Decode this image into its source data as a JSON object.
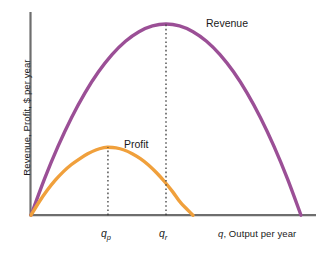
{
  "chart_data": {
    "type": "line",
    "title": "",
    "subtitle": "",
    "xlabel": "q, Output per year",
    "ylabel": "Revenue, Profit, $ per year",
    "xlabel_parts": {
      "variable": "q",
      "rest": ", Output per year"
    },
    "grid": false,
    "legend_position": "inline-curve-labels",
    "axis": {
      "x_range": [
        0,
        1
      ],
      "y_range": [
        0,
        1
      ],
      "x_ticks": [
        "q_p",
        "q_r"
      ],
      "x_tick_values": [
        0.285,
        0.5
      ],
      "y_ticks": []
    },
    "annotations": [
      {
        "name": "dropline-profit-peak",
        "x": 0.285,
        "y_from": 0,
        "y_to": 0.355,
        "style": "dotted"
      },
      {
        "name": "dropline-revenue-peak",
        "x": 0.5,
        "y_from": 0,
        "y_to": 1.0,
        "style": "dotted"
      }
    ],
    "series": [
      {
        "name": "Revenue",
        "label": "Revenue",
        "color": "#9b4f96",
        "shape": "concave-parabola",
        "x_intercepts": [
          0.0,
          1.0
        ],
        "peak": {
          "x": 0.5,
          "y": 1.0
        },
        "points": [
          {
            "x": 0.0,
            "y": 0.0
          },
          {
            "x": 0.05,
            "y": 0.19
          },
          {
            "x": 0.1,
            "y": 0.36
          },
          {
            "x": 0.15,
            "y": 0.51
          },
          {
            "x": 0.2,
            "y": 0.64
          },
          {
            "x": 0.25,
            "y": 0.75
          },
          {
            "x": 0.3,
            "y": 0.84
          },
          {
            "x": 0.35,
            "y": 0.91
          },
          {
            "x": 0.4,
            "y": 0.96
          },
          {
            "x": 0.45,
            "y": 0.99
          },
          {
            "x": 0.5,
            "y": 1.0
          },
          {
            "x": 0.55,
            "y": 0.99
          },
          {
            "x": 0.6,
            "y": 0.96
          },
          {
            "x": 0.65,
            "y": 0.91
          },
          {
            "x": 0.7,
            "y": 0.84
          },
          {
            "x": 0.75,
            "y": 0.75
          },
          {
            "x": 0.8,
            "y": 0.64
          },
          {
            "x": 0.85,
            "y": 0.51
          },
          {
            "x": 0.9,
            "y": 0.36
          },
          {
            "x": 0.95,
            "y": 0.19
          },
          {
            "x": 1.0,
            "y": 0.0
          }
        ]
      },
      {
        "name": "Profit",
        "label": "Profit",
        "color": "#f0a03c",
        "shape": "concave-parabola",
        "x_intercepts": [
          0.0,
          0.6
        ],
        "peak": {
          "x": 0.285,
          "y": 0.355
        },
        "points": [
          {
            "x": 0.0,
            "y": 0.0
          },
          {
            "x": 0.03,
            "y": 0.069
          },
          {
            "x": 0.06,
            "y": 0.13
          },
          {
            "x": 0.09,
            "y": 0.183
          },
          {
            "x": 0.12,
            "y": 0.228
          },
          {
            "x": 0.15,
            "y": 0.265
          },
          {
            "x": 0.18,
            "y": 0.295
          },
          {
            "x": 0.21,
            "y": 0.321
          },
          {
            "x": 0.24,
            "y": 0.341
          },
          {
            "x": 0.27,
            "y": 0.353
          },
          {
            "x": 0.285,
            "y": 0.355
          },
          {
            "x": 0.315,
            "y": 0.352
          },
          {
            "x": 0.345,
            "y": 0.341
          },
          {
            "x": 0.375,
            "y": 0.322
          },
          {
            "x": 0.405,
            "y": 0.296
          },
          {
            "x": 0.435,
            "y": 0.263
          },
          {
            "x": 0.465,
            "y": 0.222
          },
          {
            "x": 0.495,
            "y": 0.175
          },
          {
            "x": 0.525,
            "y": 0.122
          },
          {
            "x": 0.555,
            "y": 0.064
          },
          {
            "x": 0.6,
            "y": 0.0
          }
        ]
      }
    ],
    "colors": {
      "revenue": "#9b4f96",
      "profit": "#f0a03c",
      "axis": "#6e6e6e",
      "text": "#1a1a1a",
      "dotted": "#3a3a3a",
      "background": "#ffffff"
    }
  }
}
